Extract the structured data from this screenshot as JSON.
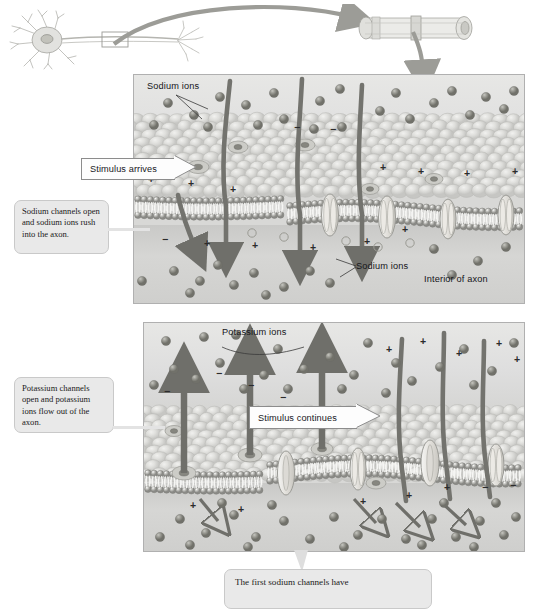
{
  "figure": {
    "panels": [
      {
        "id": "panel-top",
        "labels": {
          "sodium_ions_top": "Sodium ions",
          "sodium_ions_interior": "Sodium ions",
          "interior_of_axon": "Interior of axon"
        },
        "callouts": [
          {
            "id": "stimulus-arrives",
            "text": "Stimulus arrives",
            "shape": "arrow-right"
          },
          {
            "id": "sodium-channels-open",
            "text": "Sodium channels open and sodium ions rush into the axon.",
            "shape": "rounded-box"
          }
        ]
      },
      {
        "id": "panel-bottom",
        "labels": {
          "potassium_ions": "Potassium ions"
        },
        "callouts": [
          {
            "id": "stimulus-continues",
            "text": "Stimulus continues",
            "shape": "arrow-right"
          },
          {
            "id": "potassium-channels-open",
            "text": "Potassium channels open and potassium ions flow out of the axon.",
            "shape": "rounded-box"
          }
        ]
      }
    ],
    "bottom_caption": "The first sodium channels have",
    "charge_symbols": {
      "positive": "+",
      "negative": "−"
    },
    "colors": {
      "panel_exterior": "#e3e3e1",
      "panel_interior": "#cfcfcd",
      "ion_fill": "#8d8d86",
      "callout_bg": "#e9e9e9",
      "callout_border": "#c9c9c9",
      "arrowbox_bg": "#fdfdfd",
      "arrow_stroke": "#6f6f6a",
      "panel_border": "#b0b0b0"
    }
  }
}
